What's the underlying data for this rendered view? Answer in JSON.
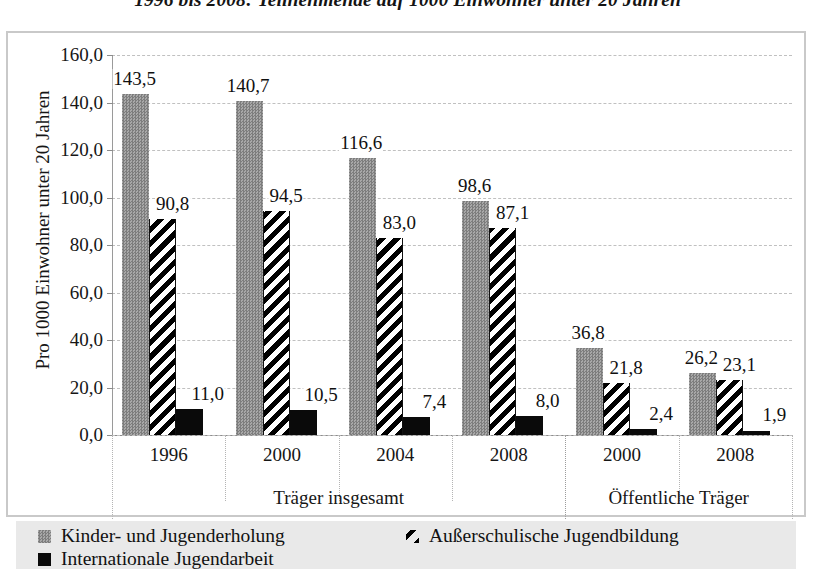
{
  "chart_data": {
    "type": "bar",
    "title": "1996 bis 2008: Teilnehmende auf 1000 Einwohner unter 20 Jahren",
    "xlabel": "",
    "ylabel": "Pro 1000 Einwohner unter 20 Jahren",
    "ylim": [
      0,
      160
    ],
    "ytick_labels": [
      "0,0",
      "20,0",
      "40,0",
      "60,0",
      "80,0",
      "100,0",
      "120,0",
      "140,0",
      "160,0"
    ],
    "ytick_values": [
      0,
      20,
      40,
      60,
      80,
      100,
      120,
      140,
      160
    ],
    "grid": true,
    "legend_position": "bottom",
    "categories": [
      "1996",
      "2000",
      "2004",
      "2008",
      "2000",
      "2008"
    ],
    "groups": [
      {
        "label": "Träger insgesamt",
        "categories": [
          "1996",
          "2000",
          "2004",
          "2008"
        ]
      },
      {
        "label": "Öffentliche Träger",
        "categories": [
          "2000",
          "2008"
        ]
      }
    ],
    "series": [
      {
        "name": "Kinder- und Jugenderholung",
        "values": [
          143.5,
          140.7,
          116.6,
          98.6,
          36.8,
          26.2
        ],
        "labels": [
          "143,5",
          "140,7",
          "116,6",
          "98,6",
          "36,8",
          "26,2"
        ],
        "fill": "grey",
        "color": "#949494"
      },
      {
        "name": "Außerschulische Jugendbildung",
        "values": [
          90.8,
          94.5,
          83.0,
          87.1,
          21.8,
          23.1
        ],
        "labels": [
          "90,8",
          "94,5",
          "83,0",
          "87,1",
          "21,8",
          "23,1"
        ],
        "fill": "diagonal-hatch",
        "color": "#000000"
      },
      {
        "name": "Internationale Jugendarbeit",
        "values": [
          11.0,
          10.5,
          7.4,
          8.0,
          2.4,
          1.9
        ],
        "labels": [
          "11,0",
          "10,5",
          "7,4",
          "8,0",
          "2,4",
          "1,9"
        ],
        "fill": "solid-black",
        "color": "#0a0a0a"
      }
    ]
  },
  "legend": {
    "items": [
      {
        "label": "Kinder- und Jugenderholung",
        "swatch": "grey"
      },
      {
        "label": "Außerschulische Jugendbildung",
        "swatch": "hatch"
      },
      {
        "label": "Internationale Jugendarbeit",
        "swatch": "black"
      }
    ]
  },
  "colors": {
    "series_grey": "#949494",
    "series_black": "#0a0a0a",
    "frame": "#c9c9c9",
    "grid": "#c0c0c0",
    "legend_background": "#e9e9e9"
  }
}
